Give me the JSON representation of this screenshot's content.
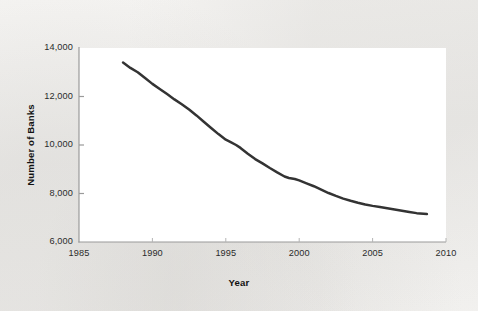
{
  "figure": {
    "background_color": "#f1f0ee",
    "plot_background_color": "#ffffff",
    "axis_color": "#9a9a9a",
    "line_color": "#333333"
  },
  "chart_data": {
    "type": "line",
    "title": "",
    "xlabel": "Year",
    "ylabel": "Number of Banks",
    "xlim": [
      1985,
      2010
    ],
    "ylim": [
      6000,
      14000
    ],
    "xticks": [
      1985,
      1990,
      1995,
      2000,
      2005,
      2010
    ],
    "xtick_labels": [
      "1985",
      "1990",
      "1995",
      "2000",
      "2005",
      "2010"
    ],
    "yticks": [
      6000,
      8000,
      10000,
      12000,
      14000
    ],
    "ytick_labels": [
      "6,000",
      "8,000",
      "10,000",
      "12,000",
      "14,000"
    ],
    "grid": false,
    "legend": null,
    "series": [
      {
        "name": "Number of Banks",
        "color": "#333333",
        "x": [
          1988.0,
          1988.5,
          1989.0,
          1989.5,
          1990.0,
          1990.5,
          1991.0,
          1991.5,
          1992.0,
          1992.5,
          1993.0,
          1993.5,
          1994.0,
          1994.5,
          1995.0,
          1995.3,
          1995.7,
          1996.0,
          1996.5,
          1997.0,
          1997.5,
          1998.0,
          1998.5,
          1999.0,
          1999.3,
          1999.7,
          2000.0,
          2000.5,
          2001.0,
          2001.5,
          2002.0,
          2002.5,
          2003.0,
          2003.5,
          2004.0,
          2004.5,
          2005.0,
          2005.5,
          2006.0,
          2006.5,
          2007.0,
          2007.5,
          2008.0,
          2008.7
        ],
        "y": [
          13400,
          13180,
          13000,
          12760,
          12520,
          12310,
          12100,
          11880,
          11680,
          11460,
          11220,
          10960,
          10700,
          10450,
          10220,
          10130,
          10000,
          9880,
          9640,
          9420,
          9240,
          9050,
          8870,
          8700,
          8640,
          8600,
          8540,
          8420,
          8300,
          8160,
          8020,
          7900,
          7790,
          7700,
          7620,
          7550,
          7490,
          7440,
          7390,
          7340,
          7290,
          7240,
          7190,
          7150
        ]
      }
    ]
  },
  "axis_labels": {
    "y": [
      {
        "value": 14000,
        "text": "14,000"
      },
      {
        "value": 12000,
        "text": "12,000"
      },
      {
        "value": 10000,
        "text": "10,000"
      },
      {
        "value": 8000,
        "text": "8,000"
      },
      {
        "value": 6000,
        "text": "6,000"
      }
    ],
    "x": [
      {
        "value": 1985,
        "text": "1985"
      },
      {
        "value": 1990,
        "text": "1990"
      },
      {
        "value": 1995,
        "text": "1995"
      },
      {
        "value": 2000,
        "text": "2000"
      },
      {
        "value": 2005,
        "text": "2005"
      },
      {
        "value": 2010,
        "text": "2010"
      }
    ]
  }
}
